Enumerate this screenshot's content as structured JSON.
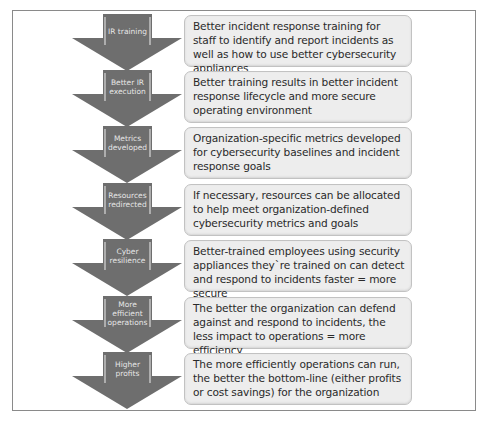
{
  "diagram": {
    "type": "vertical-arrow-process",
    "colors": {
      "arrow_fill": "#6e6e6e",
      "arrow_edge": "#d9d9d9",
      "arrow_text": "#e6e6e6",
      "box_fill": "#ededed",
      "box_border": "#c2c2c2",
      "frame_border": "#8a8a8a"
    },
    "steps": [
      {
        "label": "IR training",
        "description": "Better incident response training for staff to identify and report incidents as well as how to use better cybersecurity appliances"
      },
      {
        "label": "Better IR execution",
        "description": "Better training results in better incident response lifecycle and more secure operating environment"
      },
      {
        "label": "Metrics developed",
        "description": "Organization-specific metrics developed for cybersecurity baselines and incident response goals"
      },
      {
        "label": "Resources redirected",
        "description": "If necessary, resources can be allocated to help meet organization-defined cybersecurity metrics and goals"
      },
      {
        "label": "Cyber resilience",
        "description": "Better-trained employees using security appliances they`re trained on can detect and respond to incidents faster = more secure"
      },
      {
        "label": "More efficient operations",
        "description": "The better the organization can defend against and respond to incidents, the less impact to operations = more efficiency"
      },
      {
        "label": "Higher profits",
        "description": "The more efficiently operations can run, the better the bottom-line (either profits or cost savings) for the organization"
      }
    ]
  }
}
